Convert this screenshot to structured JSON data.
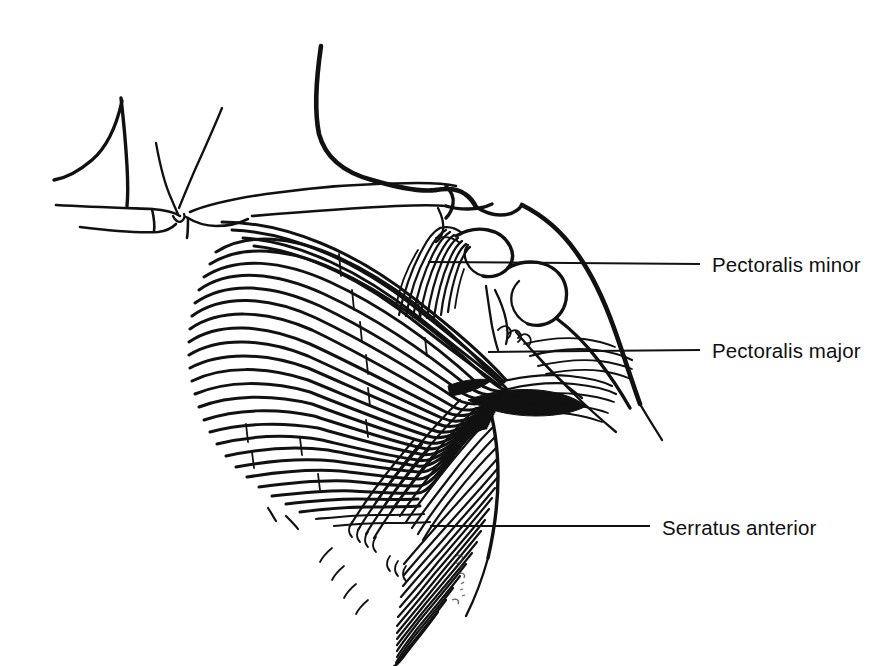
{
  "figure": {
    "background_color": "#ffffff",
    "ink_color": "#111111",
    "width": 894,
    "height": 666,
    "style": "pen-and-ink anatomical line drawing",
    "view": "right anterolateral chest and shoulder"
  },
  "labels": [
    {
      "id": "pectoralis-minor",
      "text": "Pectoralis minor",
      "text_x": 712,
      "text_y": 272,
      "leader": {
        "x1": 428,
        "y1": 262,
        "x2": 700,
        "y2": 264
      }
    },
    {
      "id": "pectoralis-major",
      "text": "Pectoralis major",
      "text_x": 712,
      "text_y": 358,
      "leader": {
        "x1": 488,
        "y1": 352,
        "x2": 700,
        "y2": 350
      }
    },
    {
      "id": "serratus-anterior",
      "text": "Serratus anterior",
      "text_x": 662,
      "text_y": 535,
      "leader": {
        "x1": 430,
        "y1": 526,
        "x2": 650,
        "y2": 526
      }
    }
  ],
  "structures": [
    {
      "id": "neck-contour",
      "name": "neck and trapezius contour"
    },
    {
      "id": "sternal-notch",
      "name": "suprasternal (jugular) notch"
    },
    {
      "id": "clavicle",
      "name": "clavicle"
    },
    {
      "id": "acromion",
      "name": "acromion process"
    },
    {
      "id": "coracoid",
      "name": "coracoid process"
    },
    {
      "id": "deltoid-outline",
      "name": "deltoid and upper arm outline"
    },
    {
      "id": "pectoralis-major",
      "name": "pectoralis major fan of fibers"
    },
    {
      "id": "pectoralis-minor",
      "name": "pectoralis minor fibers to coracoid"
    },
    {
      "id": "serratus-anterior",
      "name": "serratus anterior digitations"
    },
    {
      "id": "artist-signature",
      "name": "artist signature"
    }
  ]
}
